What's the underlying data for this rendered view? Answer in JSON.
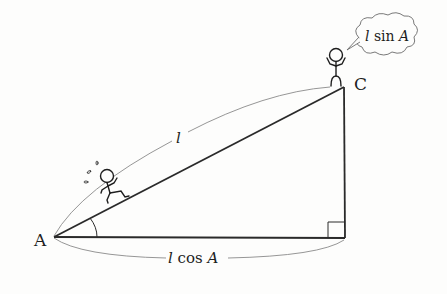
{
  "diagram": {
    "type": "right-triangle-trigonometry",
    "vertices": {
      "A": {
        "label": "A"
      },
      "C": {
        "label": "C"
      }
    },
    "sides": {
      "hypotenuse": {
        "label": "l"
      },
      "base": {
        "label_var": "l",
        "label_fn": " cos ",
        "label_arg": "A"
      },
      "height": {
        "label_var": "l",
        "label_fn": " sin ",
        "label_arg": "A"
      }
    },
    "angle_mark": "A",
    "right_angle_mark": true,
    "figures": [
      {
        "role": "runner-climbing-hypotenuse"
      },
      {
        "role": "person-standing-at-C-thinking"
      }
    ],
    "thought_bubble": {
      "text_var": "l",
      "text_fn": " sin ",
      "text_arg": "A"
    },
    "colors": {
      "line": "#2a2a2a",
      "arc": "#8a8a8a",
      "background": "#fdfdfc"
    }
  }
}
